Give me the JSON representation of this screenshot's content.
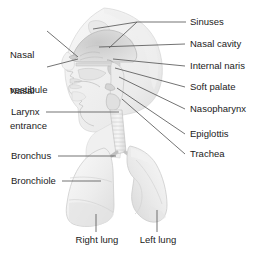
{
  "figure": {
    "style": "grayscale medical illustration with leader-line callouts",
    "colors": {
      "background": "#ffffff",
      "text": "#1b1b1b",
      "leader_line": "#555555",
      "anatomy_fill_light": "#f2f2f2",
      "anatomy_fill_mid": "#e2e2e2",
      "anatomy_fill_dark": "#c9c9c9",
      "anatomy_outline": "#b0b0b0",
      "cavity_shade": "#d8d8d8"
    }
  },
  "labels": {
    "nasal_vestibule": "Nasal\nvestibule",
    "nasal_vestibule_line1": "Nasal",
    "nasal_vestibule_line2": "vestibule",
    "nasal_entrance_line1": "Nasal",
    "nasal_entrance_line2": "entrance",
    "larynx": "Larynx",
    "bronchus": "Bronchus",
    "bronchiole": "Bronchiole",
    "sinuses": "Sinuses",
    "nasal_cavity": "Nasal cavity",
    "internal_naris": "Internal naris",
    "soft_palate": "Soft palate",
    "nasopharynx": "Nasopharynx",
    "epiglottis": "Epiglottis",
    "trachea": "Trachea",
    "right_lung": "Right lung",
    "left_lung": "Left lung"
  },
  "callouts": [
    {
      "name": "nasal-vestibule",
      "text": "Nasal vestibule",
      "side": "left",
      "label_x": 10,
      "label_y": 30,
      "target_x": 77,
      "target_y": 57
    },
    {
      "name": "nasal-entrance",
      "text": "Nasal entrance",
      "side": "left",
      "label_x": 10,
      "label_y": 66,
      "target_x": 77,
      "target_y": 59
    },
    {
      "name": "larynx",
      "text": "Larynx",
      "side": "left",
      "label_x": 12,
      "label_y": 108,
      "target_x": 117,
      "target_y": 112
    },
    {
      "name": "bronchus",
      "text": "Bronchus",
      "side": "left",
      "label_x": 12,
      "label_y": 150,
      "target_x": 118,
      "target_y": 155
    },
    {
      "name": "bronchiole",
      "text": "Bronchiole",
      "side": "left",
      "label_x": 12,
      "label_y": 176,
      "target_x": 100,
      "target_y": 181
    },
    {
      "name": "sinuses",
      "text": "Sinuses",
      "side": "right",
      "label_x": 188,
      "label_y": 18,
      "target_x": 92,
      "target_y": 30
    },
    {
      "name": "nasal-cavity",
      "text": "Nasal cavity",
      "side": "right",
      "label_x": 188,
      "label_y": 40,
      "target_x": 98,
      "target_y": 48
    },
    {
      "name": "internal-naris",
      "text": "Internal naris",
      "side": "right",
      "label_x": 188,
      "label_y": 62,
      "target_x": 110,
      "target_y": 60
    },
    {
      "name": "soft-palate",
      "text": "Soft palate",
      "side": "right",
      "label_x": 188,
      "label_y": 83,
      "target_x": 113,
      "target_y": 68
    },
    {
      "name": "nasopharynx",
      "text": "Nasopharynx",
      "side": "right",
      "label_x": 188,
      "label_y": 105,
      "target_x": 116,
      "target_y": 76
    },
    {
      "name": "epiglottis",
      "text": "Epiglottis",
      "side": "right",
      "label_x": 188,
      "label_y": 130,
      "target_x": 118,
      "target_y": 88
    },
    {
      "name": "trachea",
      "text": "Trachea",
      "side": "right",
      "label_x": 188,
      "label_y": 150,
      "target_x": 120,
      "target_y": 98
    },
    {
      "name": "right-lung",
      "text": "Right lung",
      "side": "bottom",
      "label_x": 70,
      "label_y": 236,
      "target_x": 96,
      "target_y": 215
    },
    {
      "name": "left-lung",
      "text": "Left lung",
      "side": "bottom",
      "label_x": 136,
      "label_y": 236,
      "target_x": 156,
      "target_y": 212
    }
  ]
}
